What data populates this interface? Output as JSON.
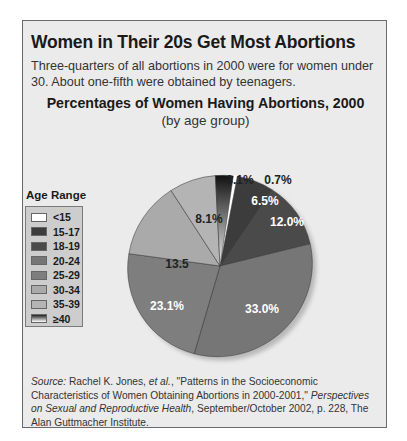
{
  "header": {
    "title": "Women in Their 20s Get Most Abortions",
    "subtitle": "Three-quarters of all abortions in 2000 were for women under 30. About one-fifth were obtained by teenagers."
  },
  "chart_data": {
    "type": "pie",
    "title": "Percentages of Women Having Abortions, 2000",
    "subtitle": "(by age group)",
    "legend_title": "Age Range",
    "legend_position": "left",
    "categories": [
      "<15",
      "15-17",
      "18-19",
      "20-24",
      "25-29",
      "30-34",
      "35-39",
      "≥40"
    ],
    "values": [
      0.7,
      6.5,
      12.0,
      33.0,
      23.1,
      13.5,
      8.1,
      3.1
    ],
    "labels": [
      "0.7%",
      "6.5%",
      "12.0%",
      "33.0%",
      "23.1%",
      "13.5",
      "8.1%",
      "3.1%"
    ],
    "colors": [
      "#ffffff",
      "#3c3c3c",
      "#4a4a4a",
      "#767676",
      "#7e7e7e",
      "#aaaaaa",
      "#b4b4b4",
      "#gradient"
    ]
  },
  "legend": {
    "title": "Age Range",
    "items": [
      {
        "label": "<15",
        "color": "#ffffff"
      },
      {
        "label": "15-17",
        "color": "#3c3c3c"
      },
      {
        "label": "18-19",
        "color": "#4a4a4a"
      },
      {
        "label": "20-24",
        "color": "#767676"
      },
      {
        "label": "25-29",
        "color": "#7e7e7e"
      },
      {
        "label": "30-34",
        "color": "#aaaaaa"
      },
      {
        "label": "35-39",
        "color": "#b4b4b4"
      },
      {
        "label": "≥40",
        "color": "gradient"
      }
    ]
  },
  "source": {
    "prefix": "Source:",
    "author": " Rachel K. Jones, ",
    "etal": "et al.",
    "text1": ", \"Patterns in the Socioeconomic Characteristics of Women Obtaining Abortions in 2000-2001,\" ",
    "journal": "Perspectives on Sexual and Reproductive Health",
    "text2": ", September/October 2002, p. 228, The Alan Guttmacher Institute."
  }
}
